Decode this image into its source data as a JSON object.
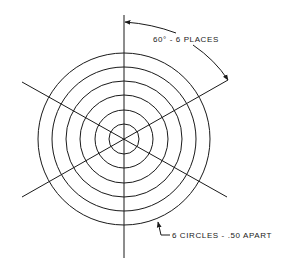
{
  "diagram": {
    "type": "technical-drawing",
    "center": {
      "x": 124,
      "y": 139
    },
    "circles": {
      "count": 6,
      "radii_px": [
        15,
        29,
        44,
        58,
        72,
        86
      ]
    },
    "radial_lines": {
      "count": 6,
      "angle_spacing_deg": 60,
      "angles_deg": [
        90,
        150,
        210,
        270,
        330,
        30
      ]
    },
    "annotations": {
      "angle_label": "60° - 6 PLACES",
      "circle_label": "6 CIRCLES - .50 APART"
    },
    "stroke_color": "#1a1a1a",
    "background_color": "#ffffff"
  }
}
